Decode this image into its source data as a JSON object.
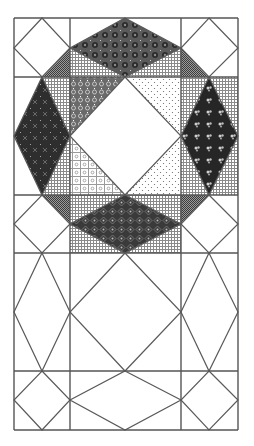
{
  "diagram": {
    "title": "",
    "kind": "quilt-block-pattern",
    "canvas": {
      "width": 254,
      "height": 446
    },
    "grid": {
      "x": [
        14,
        70,
        181,
        238
      ],
      "y": [
        18,
        77,
        195,
        253,
        371,
        430
      ],
      "line_color": "#555555"
    },
    "fabrics": {
      "white": "#ffffff",
      "grid_light": "#bdbdbd",
      "checker_dark": "#6e6e6e",
      "dark_medallion": "#3a3a3a",
      "dark_cross": "#2e2e2e",
      "dark_floral": "#262626",
      "dark_diamond_lattice": "#353535",
      "medium_lattice": "#6a6a6a",
      "light_dots": "#e6e6e6",
      "light_floral": "#dcdcdc"
    },
    "shapes": [
      {
        "name": "top-left-corner-checker-triangle",
        "fabric": "checker_dark",
        "points": [
          [
            70,
            48
          ],
          [
            70,
            77
          ],
          [
            42,
            77
          ]
        ]
      },
      {
        "name": "top-right-corner-checker-triangle",
        "fabric": "checker_dark",
        "points": [
          [
            181,
            48
          ],
          [
            181,
            77
          ],
          [
            209,
            77
          ]
        ]
      },
      {
        "name": "bottom-left-corner-checker-triangle",
        "fabric": "checker_dark",
        "points": [
          [
            42,
            195
          ],
          [
            70,
            195
          ],
          [
            70,
            224
          ]
        ]
      },
      {
        "name": "bottom-right-corner-checker-triangle",
        "fabric": "checker_dark",
        "points": [
          [
            181,
            195
          ],
          [
            209,
            195
          ],
          [
            181,
            224
          ]
        ]
      },
      {
        "name": "top-middle-grid-left-triangle",
        "fabric": "grid_light",
        "points": [
          [
            70,
            48
          ],
          [
            125,
            77
          ],
          [
            70,
            77
          ]
        ]
      },
      {
        "name": "top-middle-grid-right-triangle",
        "fabric": "grid_light",
        "points": [
          [
            181,
            48
          ],
          [
            181,
            77
          ],
          [
            125,
            77
          ]
        ]
      },
      {
        "name": "top-diamond",
        "fabric": "dark_medallion",
        "points": [
          [
            125,
            18
          ],
          [
            181,
            48
          ],
          [
            125,
            77
          ],
          [
            70,
            48
          ]
        ]
      },
      {
        "name": "left-grid-upper-triangle",
        "fabric": "grid_light",
        "points": [
          [
            42,
            77
          ],
          [
            70,
            77
          ],
          [
            70,
            136
          ]
        ]
      },
      {
        "name": "left-grid-lower-triangle",
        "fabric": "grid_light",
        "points": [
          [
            70,
            136
          ],
          [
            70,
            195
          ],
          [
            42,
            195
          ]
        ]
      },
      {
        "name": "left-diamond",
        "fabric": "dark_cross",
        "points": [
          [
            42,
            77
          ],
          [
            70,
            136
          ],
          [
            42,
            195
          ],
          [
            14,
            136
          ]
        ]
      },
      {
        "name": "right-grid-outer-upper",
        "fabric": "grid_light",
        "points": [
          [
            209,
            77
          ],
          [
            238,
            77
          ],
          [
            238,
            136
          ]
        ]
      },
      {
        "name": "right-grid-outer-lower",
        "fabric": "grid_light",
        "points": [
          [
            238,
            136
          ],
          [
            238,
            195
          ],
          [
            209,
            195
          ]
        ]
      },
      {
        "name": "right-grid-inner-upper",
        "fabric": "grid_light",
        "points": [
          [
            181,
            77
          ],
          [
            209,
            77
          ],
          [
            181,
            136
          ]
        ]
      },
      {
        "name": "right-grid-inner-lower",
        "fabric": "grid_light",
        "points": [
          [
            181,
            136
          ],
          [
            209,
            195
          ],
          [
            181,
            195
          ]
        ]
      },
      {
        "name": "right-diamond",
        "fabric": "dark_floral",
        "points": [
          [
            209,
            77
          ],
          [
            238,
            136
          ],
          [
            209,
            195
          ],
          [
            181,
            136
          ]
        ]
      },
      {
        "name": "bottom-middle-grid-background",
        "fabric": "grid_light",
        "points": [
          [
            70,
            195
          ],
          [
            181,
            195
          ],
          [
            181,
            253
          ],
          [
            70,
            253
          ]
        ]
      },
      {
        "name": "bottom-diamond",
        "fabric": "dark_diamond_lattice",
        "points": [
          [
            125,
            195
          ],
          [
            181,
            224
          ],
          [
            125,
            253
          ],
          [
            70,
            224
          ]
        ]
      },
      {
        "name": "center-top-left-triangle",
        "fabric": "medium_lattice",
        "points": [
          [
            70,
            77
          ],
          [
            125,
            77
          ],
          [
            70,
            136
          ]
        ]
      },
      {
        "name": "center-top-right-triangle",
        "fabric": "light_dots",
        "points": [
          [
            125,
            77
          ],
          [
            181,
            77
          ],
          [
            181,
            136
          ]
        ]
      },
      {
        "name": "center-bottom-left-triangle",
        "fabric": "light_floral",
        "points": [
          [
            70,
            136
          ],
          [
            125,
            195
          ],
          [
            70,
            195
          ]
        ]
      },
      {
        "name": "center-bottom-right-triangle",
        "fabric": "light_dots",
        "points": [
          [
            181,
            136
          ],
          [
            181,
            195
          ],
          [
            125,
            195
          ]
        ]
      },
      {
        "name": "center-white-diamond",
        "fabric": "white",
        "points": [
          [
            125,
            77
          ],
          [
            181,
            136
          ],
          [
            125,
            195
          ],
          [
            70,
            136
          ]
        ]
      }
    ],
    "outline_lines": [
      {
        "name": "tl-cell-diamond",
        "points": [
          [
            42,
            18
          ],
          [
            70,
            48
          ],
          [
            42,
            77
          ],
          [
            14,
            48
          ]
        ]
      },
      {
        "name": "tr-cell-diamond",
        "points": [
          [
            209,
            18
          ],
          [
            238,
            48
          ],
          [
            209,
            77
          ],
          [
            181,
            48
          ]
        ]
      },
      {
        "name": "bl-cell-diamond",
        "points": [
          [
            42,
            195
          ],
          [
            70,
            224
          ],
          [
            42,
            253
          ],
          [
            14,
            224
          ]
        ]
      },
      {
        "name": "br-cell-diamond",
        "points": [
          [
            209,
            195
          ],
          [
            238,
            224
          ],
          [
            209,
            253
          ],
          [
            181,
            224
          ]
        ]
      },
      {
        "name": "lower-left-tall-diamond",
        "points": [
          [
            42,
            253
          ],
          [
            70,
            312
          ],
          [
            42,
            371
          ],
          [
            14,
            312
          ]
        ]
      },
      {
        "name": "lower-center-diamond",
        "points": [
          [
            125,
            253
          ],
          [
            181,
            312
          ],
          [
            125,
            371
          ],
          [
            70,
            312
          ]
        ]
      },
      {
        "name": "lower-right-tall-diamond",
        "points": [
          [
            209,
            253
          ],
          [
            238,
            312
          ],
          [
            209,
            371
          ],
          [
            181,
            312
          ]
        ]
      },
      {
        "name": "bottom-left-small-diamond",
        "points": [
          [
            42,
            371
          ],
          [
            70,
            400
          ],
          [
            42,
            430
          ],
          [
            14,
            400
          ]
        ]
      },
      {
        "name": "bottom-center-flat-diamond",
        "points": [
          [
            125,
            371
          ],
          [
            181,
            400
          ],
          [
            125,
            430
          ],
          [
            70,
            400
          ]
        ]
      },
      {
        "name": "bottom-right-small-diamond",
        "points": [
          [
            209,
            371
          ],
          [
            238,
            400
          ],
          [
            209,
            430
          ],
          [
            181,
            400
          ]
        ]
      },
      {
        "name": "top-diamond-edge",
        "points": [
          [
            125,
            18
          ],
          [
            181,
            48
          ],
          [
            125,
            77
          ],
          [
            70,
            48
          ]
        ]
      },
      {
        "name": "left-diamond-edge",
        "points": [
          [
            42,
            77
          ],
          [
            70,
            136
          ],
          [
            42,
            195
          ],
          [
            14,
            136
          ]
        ]
      },
      {
        "name": "right-diamond-edge",
        "points": [
          [
            209,
            77
          ],
          [
            238,
            136
          ],
          [
            209,
            195
          ],
          [
            181,
            136
          ]
        ]
      },
      {
        "name": "bottom-diamond-edge",
        "points": [
          [
            125,
            195
          ],
          [
            181,
            224
          ],
          [
            125,
            253
          ],
          [
            70,
            224
          ]
        ]
      },
      {
        "name": "center-diamond-edge",
        "points": [
          [
            125,
            77
          ],
          [
            181,
            136
          ],
          [
            125,
            195
          ],
          [
            70,
            136
          ]
        ]
      }
    ]
  }
}
